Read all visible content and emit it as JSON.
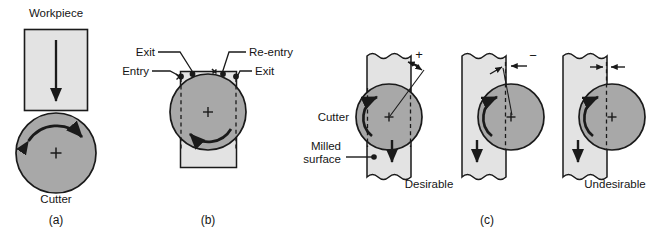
{
  "figure": {
    "background": "#ffffff",
    "colors": {
      "workpiece_fill": "#e3e3e3",
      "cutter_fill": "#a8a8a8",
      "outline": "#1a1a1a",
      "text": "#151515"
    }
  },
  "panel_a": {
    "caption": "(a)",
    "workpiece_label": "Workpiece",
    "cutter_label": "Cutter",
    "feed_arrow_direction": "down",
    "cutter_rotation": "clockwise",
    "center_marker": "+"
  },
  "panel_b": {
    "caption": "(b)",
    "labels": {
      "exit_left": "Exit",
      "entry_left": "Entry",
      "reentry_right": "Re-entry",
      "exit_right": "Exit"
    },
    "cutter_rotation": "counter-clockwise",
    "center_marker": "+",
    "dashed_lines": 2
  },
  "panel_c": {
    "caption": "(c)",
    "cutter_label": "Cutter",
    "milled_surface_label": "Milled\nsurface",
    "milled_surface_line1": "Milled",
    "milled_surface_line2": "surface",
    "diagrams": [
      {
        "name": "centered",
        "sign": "+",
        "verdict": "Desirable",
        "feed_arrow_direction": "down",
        "cutter_rotation": "counter-clockwise",
        "center_marker": "+"
      },
      {
        "name": "offset-right-negative",
        "sign": "−",
        "verdict": "",
        "feed_arrow_direction": "down",
        "cutter_rotation": "counter-clockwise",
        "center_marker": "+"
      },
      {
        "name": "offset-right-zero",
        "sign": "",
        "verdict": "Undesirable",
        "feed_arrow_direction": "down",
        "cutter_rotation": "counter-clockwise",
        "center_marker": "+"
      }
    ]
  }
}
